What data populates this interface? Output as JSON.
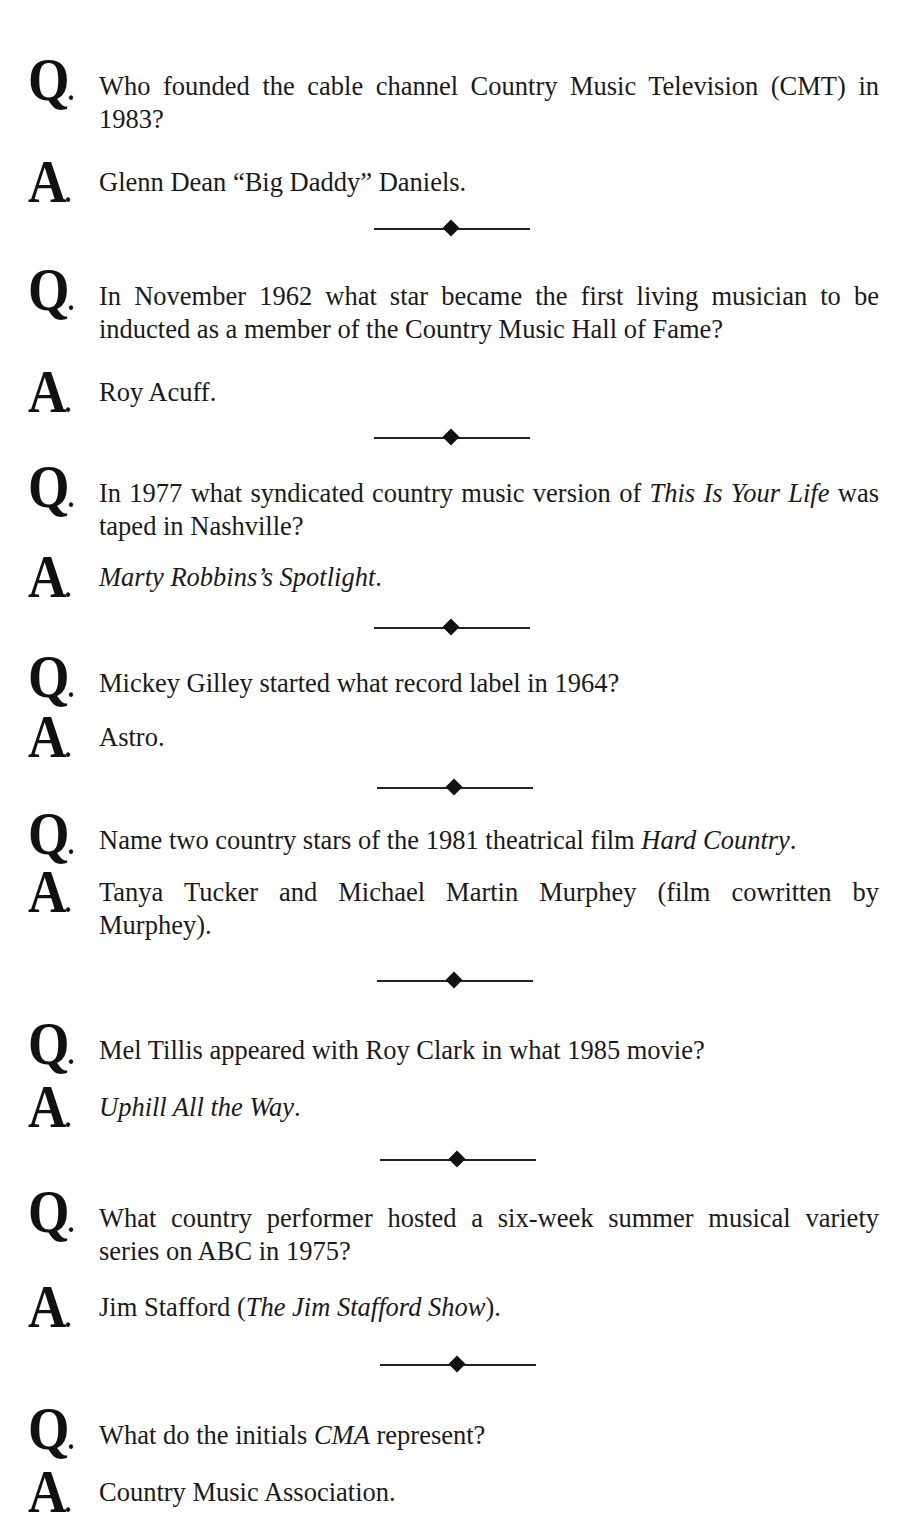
{
  "labels": {
    "question": "Q",
    "answer": "A",
    "dot": "."
  },
  "items": [
    {
      "question": [
        {
          "t": "Who founded the cable channel Country Music Television (CMT) in 1983?"
        }
      ],
      "answer": [
        {
          "t": "Glenn Dean “Big Daddy” Daniels."
        }
      ]
    },
    {
      "question": [
        {
          "t": "In November 1962 what star became the first living musician to be inducted as a member of the Country Music Hall of Fame?"
        }
      ],
      "answer": [
        {
          "t": "Roy Acuff."
        }
      ]
    },
    {
      "question": [
        {
          "t": "In 1977 what syndicated country music version of "
        },
        {
          "t": "This Is Your Life",
          "i": true
        },
        {
          "t": " was taped in Nashville?"
        }
      ],
      "answer": [
        {
          "t": "Marty Robbins’s Spotlight",
          "i": true
        },
        {
          "t": "."
        }
      ]
    },
    {
      "question": [
        {
          "t": "Mickey Gilley started what record label in 1964?"
        }
      ],
      "answer": [
        {
          "t": "Astro."
        }
      ]
    },
    {
      "question": [
        {
          "t": "Name two country stars of the 1981 theatrical film "
        },
        {
          "t": "Hard Country",
          "i": true
        },
        {
          "t": "."
        }
      ],
      "answer": [
        {
          "t": "Tanya Tucker and Michael Martin Murphey (film cowritten by Murphey)."
        }
      ]
    },
    {
      "question": [
        {
          "t": "Mel Tillis appeared with Roy Clark in what 1985 movie?"
        }
      ],
      "answer": [
        {
          "t": "Uphill All the Way",
          "i": true
        },
        {
          "t": "."
        }
      ]
    },
    {
      "question": [
        {
          "t": "What country performer hosted a six-week summer musical variety series on ABC in 1975?"
        }
      ],
      "answer": [
        {
          "t": "Jim Stafford ("
        },
        {
          "t": "The Jim Stafford Show",
          "i": true
        },
        {
          "t": ")."
        }
      ]
    },
    {
      "question": [
        {
          "t": "What do the initials "
        },
        {
          "t": "CMA",
          "i": true
        },
        {
          "t": " represent?"
        }
      ],
      "answer": [
        {
          "t": "Country Music Association."
        }
      ]
    }
  ],
  "layout": {
    "q_tops": [
      48,
      258,
      455,
      645,
      802,
      1012,
      1180,
      1397
    ],
    "a_tops": [
      150,
      360,
      545,
      705,
      860,
      1075,
      1275,
      1460
    ],
    "divider_tops": [
      221,
      430,
      620,
      780,
      973,
      1152,
      1357
    ],
    "divider_lefts": [
      374,
      374,
      374,
      377,
      377,
      380,
      380
    ]
  }
}
